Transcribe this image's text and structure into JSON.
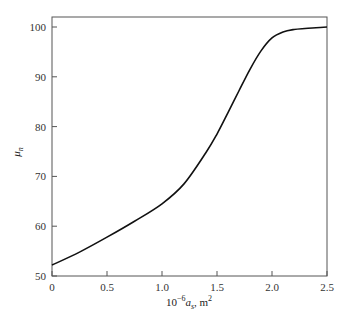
{
  "chart_data": {
    "type": "line",
    "title": "",
    "xlabel": "10^-6 a_s, m^2",
    "xlabel_parts": {
      "prefix": "10",
      "exp": "−6",
      "var": "a",
      "sub": "s",
      "suffix": ", m",
      "unit_exp": "2"
    },
    "ylabel": "μ_n",
    "ylabel_parts": {
      "var": "μ",
      "sub": "n"
    },
    "xlim": [
      0,
      2.5
    ],
    "ylim": [
      50,
      102
    ],
    "xticks": [
      "0",
      "0.5",
      "1.0",
      "1.5",
      "2.0",
      "2.5"
    ],
    "yticks": [
      "50",
      "60",
      "70",
      "80",
      "90",
      "100"
    ],
    "grid": false,
    "legend": null,
    "series": [
      {
        "name": "μ_n",
        "color": "#111111",
        "x": [
          0,
          0.25,
          0.5,
          0.75,
          1.0,
          1.2,
          1.4,
          1.5,
          1.6,
          1.7,
          1.8,
          1.9,
          2.0,
          2.1,
          2.2,
          2.3,
          2.4,
          2.5
        ],
        "y": [
          52.2,
          54.8,
          57.8,
          61.0,
          64.5,
          68.5,
          74.8,
          78.5,
          82.8,
          87.2,
          91.5,
          95.2,
          97.8,
          99.0,
          99.5,
          99.7,
          99.85,
          100.0
        ]
      }
    ]
  }
}
